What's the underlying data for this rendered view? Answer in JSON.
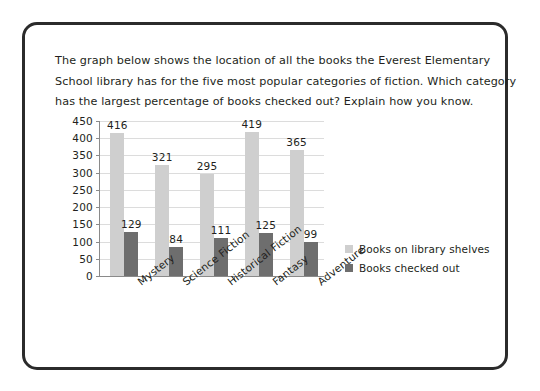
{
  "card": {
    "border_color": "#2b2b2b",
    "background": "#ffffff"
  },
  "prompt": {
    "line1": "The graph below shows the location of all the books the Everest Elementary",
    "line2": "School library has for the five most popular categories of fiction. Which category",
    "line3": "has the largest percentage of books checked out? Explain how you know."
  },
  "chart_data": {
    "type": "bar",
    "title": "",
    "xlabel": "",
    "ylabel": "",
    "ylim": [
      0,
      450
    ],
    "ytick_step": 50,
    "yticks": [
      "450",
      "400",
      "350",
      "300",
      "250",
      "200",
      "150",
      "100",
      "50",
      "0"
    ],
    "grid": true,
    "legend_position": "right",
    "categories": [
      "Mystery",
      "Science Fiction",
      "Historical Fiction",
      "Fantasy",
      "Adventure"
    ],
    "series": [
      {
        "name": "Books on library shelves",
        "color": "#cfcfcf",
        "values": [
          416,
          321,
          295,
          419,
          365
        ]
      },
      {
        "name": "Books checked out",
        "color": "#6e6e6e",
        "values": [
          129,
          84,
          111,
          125,
          99
        ]
      }
    ]
  }
}
